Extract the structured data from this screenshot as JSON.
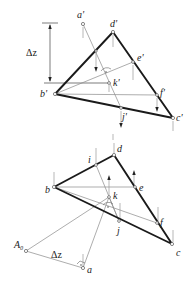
{
  "figure": {
    "elevation": {
      "labels": {
        "a": "a'",
        "b": "b'",
        "c": "c'",
        "d": "d'",
        "e": "e'",
        "f": "f'",
        "j": "j'",
        "k": "k'"
      },
      "dimension": "Δz"
    },
    "plan": {
      "labels": {
        "a": "a",
        "b": "b",
        "c": "c",
        "d": "d",
        "e": "e",
        "f": "f",
        "i": "i",
        "j": "j",
        "k": "k",
        "A0": "A₀"
      },
      "dimension": "Δz"
    }
  }
}
